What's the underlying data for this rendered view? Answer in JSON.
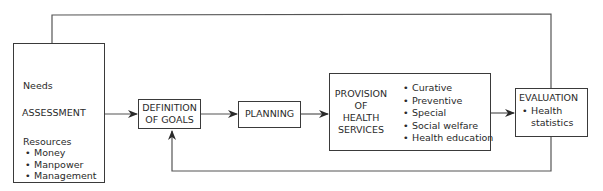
{
  "diagram": {
    "type": "flowchart",
    "nodes": {
      "assessment": {
        "needs_label": "Needs",
        "title": "ASSESSMENT",
        "resources_label": "Resources",
        "resources": [
          "Money",
          "Manpower",
          "Management"
        ]
      },
      "definition": {
        "line1": "DEFINITION",
        "line2": "OF GOALS"
      },
      "planning": {
        "label": "PLANNING"
      },
      "provision": {
        "lines": [
          "PROVISION",
          "OF",
          "HEALTH",
          "SERVICES"
        ],
        "items": [
          "Curative",
          "Preventive",
          "Special",
          "Social welfare",
          "Health education"
        ]
      },
      "evaluation": {
        "title": "EVALUATION",
        "item_line1": "Health",
        "item_line2": "statistics"
      }
    },
    "edges": [
      {
        "from": "assessment",
        "to": "definition"
      },
      {
        "from": "definition",
        "to": "planning"
      },
      {
        "from": "planning",
        "to": "provision"
      },
      {
        "from": "provision",
        "to": "evaluation"
      },
      {
        "from": "evaluation",
        "to": "assessment",
        "route": "top-loop"
      },
      {
        "from": "evaluation",
        "to": "definition",
        "route": "bottom-loop"
      }
    ],
    "colors": {
      "line": "#3a3a3a",
      "background": "#ffffff"
    }
  }
}
